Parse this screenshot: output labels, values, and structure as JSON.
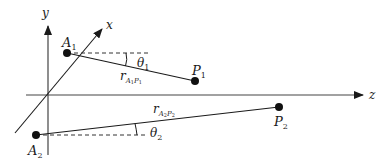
{
  "diagram": {
    "axes": {
      "y_label": "y",
      "x_label": "x",
      "z_label": "z"
    },
    "points": {
      "A1": {
        "label": "A",
        "sub": "1"
      },
      "P1": {
        "label": "P",
        "sub": "1"
      },
      "A2": {
        "label": "A",
        "sub": "2"
      },
      "P2": {
        "label": "P",
        "sub": "2"
      }
    },
    "vectors": {
      "r1": {
        "label": "r",
        "sub": "A",
        "subsub1": "1",
        "sub2": "P",
        "subsub2": "1"
      },
      "r2": {
        "label": "r",
        "sub": "A",
        "subsub1": "2",
        "sub2": "P",
        "subsub2": "2"
      }
    },
    "angles": {
      "theta1": {
        "label": "θ",
        "sub": "1"
      },
      "theta2": {
        "label": "θ",
        "sub": "2"
      }
    },
    "colors": {
      "line": "#1a1a1a",
      "axis": "#333333"
    }
  }
}
